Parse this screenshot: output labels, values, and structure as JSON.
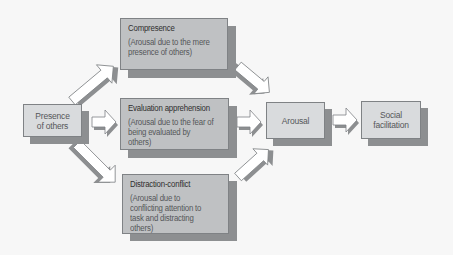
{
  "diagram": {
    "type": "flowchart",
    "colors": {
      "background": "#f7f7f7",
      "big_box_fill": "#bfc1c3",
      "small_box_fill": "#d9dbdd",
      "shadow": "#8d8f91",
      "border": "#7f8285",
      "title_text": "#2f2f2f",
      "body_text": "#555759",
      "arrow_fill": "#ffffff",
      "arrow_stroke": "#7f8285"
    },
    "nodes": {
      "presence": {
        "line1": "Presence",
        "line2": "of others"
      },
      "compresence": {
        "title": "Compresence",
        "desc": "(Arousal due to the mere presence of others)"
      },
      "evaluation": {
        "title": "Evaluation apprehension",
        "desc": "(Arousal due to the fear of being evaluated by others)"
      },
      "distraction": {
        "title": "Distraction-conflict",
        "desc": "(Arousal due to conflicting attention to task and distracting others)"
      },
      "arousal": {
        "label": "Arousal"
      },
      "social": {
        "line1": "Social",
        "line2": "facilitation"
      }
    },
    "edges": [
      {
        "from": "Presence of others",
        "to": "Compresence"
      },
      {
        "from": "Presence of others",
        "to": "Evaluation apprehension"
      },
      {
        "from": "Presence of others",
        "to": "Distraction-conflict"
      },
      {
        "from": "Compresence",
        "to": "Arousal"
      },
      {
        "from": "Evaluation apprehension",
        "to": "Arousal"
      },
      {
        "from": "Distraction-conflict",
        "to": "Arousal"
      },
      {
        "from": "Arousal",
        "to": "Social facilitation"
      }
    ]
  }
}
